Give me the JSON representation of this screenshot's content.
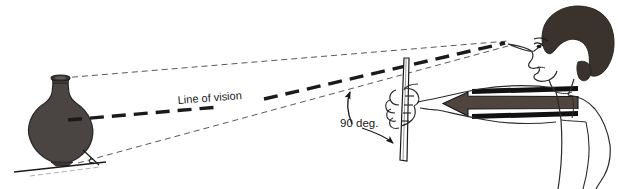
{
  "figure": {
    "type": "technical-line-diagram",
    "width": 618,
    "height": 189,
    "background_color": "#ffffff"
  },
  "labels": {
    "line_of_vision": "Line of vision",
    "angle": "90 deg."
  },
  "colors": {
    "ink": "#1a1a1a",
    "vase_fill": "#4a4542",
    "vase_outline": "#2b2724",
    "hair_fill": "#3a322c",
    "arrow_fill": "#4f443e",
    "arrow_outline": "#161616",
    "dash_light": "#555555",
    "skin_outline": "#2c2c2c"
  },
  "elements": {
    "vase": {
      "name": "ceramic pot",
      "position": "left",
      "fill": "#4a4542"
    },
    "ground_line": {
      "name": "ground line under pot"
    },
    "person": {
      "name": "observer with dark hair, facing left"
    },
    "rod": {
      "name": "vertical sighting rod held in hand"
    },
    "pointer_arrow": {
      "name": "thick horizontal arrow pointing left toward hand"
    },
    "sight_lines": [
      {
        "name": "upper sight line",
        "style": "fine dashed",
        "from": "pot rim",
        "to": "eye"
      },
      {
        "name": "center line of vision",
        "style": "bold dashed",
        "from": "pot body",
        "to": "eye"
      },
      {
        "name": "lower sight line",
        "style": "fine dashed",
        "from": "pot base",
        "to": "eye"
      }
    ],
    "angle_markers": [
      {
        "name": "angle arrow to line of vision",
        "label": "90 deg."
      },
      {
        "name": "angle arrow to rod",
        "label": "90 deg."
      }
    ],
    "right_angle_mark": {
      "name": "right angle tick at pot base"
    }
  }
}
